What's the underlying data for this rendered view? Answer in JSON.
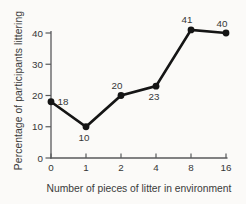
{
  "chart_data": {
    "type": "line",
    "title": "",
    "xlabel": "Number of pieces of litter in environment",
    "ylabel": "Percentage of participants littering",
    "categories": [
      "0",
      "1",
      "2",
      "4",
      "8",
      "16"
    ],
    "values": [
      18,
      10,
      20,
      23,
      41,
      40
    ],
    "point_labels": [
      "18",
      "10",
      "20",
      "23",
      "41",
      "40"
    ],
    "label_placement": [
      "right",
      "below",
      "above",
      "below",
      "above",
      "above"
    ],
    "ylim": [
      0,
      40
    ],
    "yticks": [
      0,
      10,
      20,
      30,
      40
    ],
    "grid": false,
    "legend": false,
    "colors": {
      "line": "#151515",
      "point": "#151515",
      "axis": "#58595b",
      "text": "#363636",
      "background": "#fbfaf8"
    }
  }
}
